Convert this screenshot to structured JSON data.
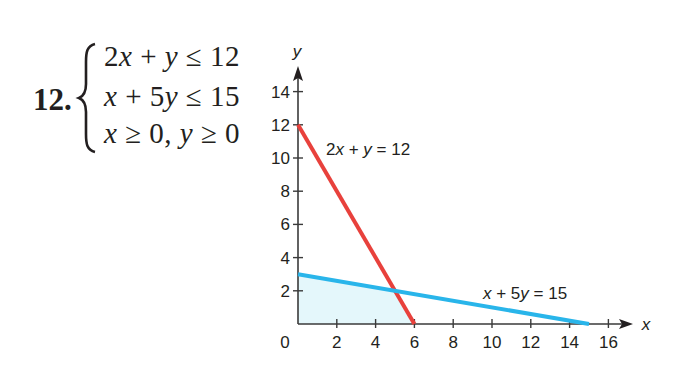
{
  "problem": {
    "number": "12.",
    "system": [
      {
        "parts": [
          {
            "t": "2",
            "v": false
          },
          {
            "t": "x",
            "v": true
          },
          {
            "t": " + ",
            "v": false
          },
          {
            "t": "y",
            "v": true
          },
          {
            "t": " ≤ 12",
            "v": false
          }
        ]
      },
      {
        "parts": [
          {
            "t": "x",
            "v": true
          },
          {
            "t": " + 5",
            "v": false
          },
          {
            "t": "y",
            "v": true
          },
          {
            "t": " ≤ 15",
            "v": false
          }
        ]
      },
      {
        "parts": [
          {
            "t": "x",
            "v": true
          },
          {
            "t": " ≥ 0, ",
            "v": false
          },
          {
            "t": "y",
            "v": true
          },
          {
            "t": " ≥ 0",
            "v": false
          }
        ]
      }
    ]
  },
  "chart_data": {
    "type": "line",
    "title": "",
    "xlabel": "x",
    "ylabel": "y",
    "xlim": [
      0,
      17
    ],
    "ylim": [
      0,
      15.5
    ],
    "x_ticks": [
      2,
      4,
      6,
      8,
      10,
      12,
      14,
      16
    ],
    "y_ticks": [
      2,
      4,
      6,
      8,
      10,
      12,
      14
    ],
    "origin_label": "0",
    "grid": false,
    "series": [
      {
        "name": "2x + y = 12",
        "color": "#e8413c",
        "points": [
          [
            0,
            12
          ],
          [
            6,
            0
          ]
        ],
        "label": "2x + y = 12",
        "label_at": [
          2.9,
          10.9
        ]
      },
      {
        "name": "x + 5y = 15",
        "color": "#29b5ea",
        "points": [
          [
            0,
            3
          ],
          [
            15,
            0
          ]
        ],
        "label": "x + 5y = 15",
        "label_at": [
          9.6,
          1.9
        ]
      }
    ],
    "feasible_region": {
      "vertices": [
        [
          0,
          0
        ],
        [
          0,
          3
        ],
        [
          5,
          2
        ],
        [
          6,
          0
        ]
      ],
      "fill": "#e4f7fb"
    },
    "intersection": [
      5,
      2
    ]
  },
  "layout": {
    "origin_px": [
      298,
      324
    ],
    "px_per_x": 19.4,
    "px_per_y": 16.6
  },
  "labels": {
    "x_axis": "x",
    "y_axis": "y",
    "line1": "2x + y = 12",
    "line2": "x + 5y = 15",
    "origin": "0"
  }
}
